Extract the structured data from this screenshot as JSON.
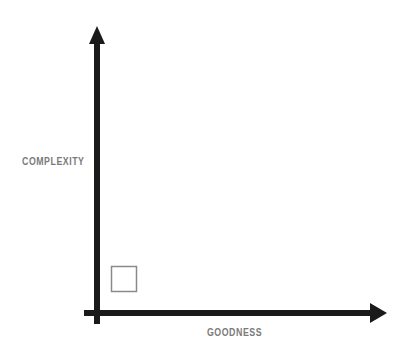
{
  "diagram": {
    "type": "quadrant-axes",
    "y_axis": {
      "label": "COMPLEXITY",
      "direction": "up"
    },
    "x_axis": {
      "label": "GOODNESS",
      "direction": "right"
    },
    "markers": [
      {
        "shape": "square",
        "style": "outline",
        "position": "low goodness, low complexity"
      }
    ],
    "colors": {
      "axis": "#1a1a1a",
      "label": "#7a7a7a",
      "marker_stroke": "#8a8a8a"
    }
  }
}
